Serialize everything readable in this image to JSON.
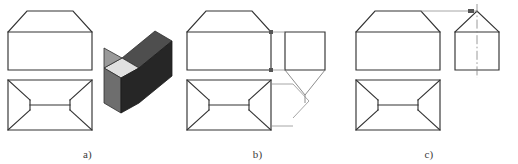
{
  "figure": {
    "type": "orthographic-projection-exercise",
    "background_color": "#ffffff",
    "line_color": "#333333",
    "thin_line_color": "#6f6f6f",
    "centerline_color": "#808080",
    "projection_line_color": "#888888",
    "width_px": 518,
    "height_px": 164
  },
  "panels": [
    {
      "id": "a",
      "label": "a)",
      "caption_position": "bottom-center",
      "views": [
        {
          "name": "front-view",
          "shape": "rectangle-with-two-top-chamfers",
          "x": 8,
          "y": 10,
          "width": 84,
          "height": 60,
          "chamfer": 22,
          "top_horizontal_line_y": 32
        },
        {
          "name": "top-view",
          "shape": "rectangle-with-four-corner-diagonals",
          "x": 8,
          "y": 80,
          "width": 84,
          "height": 50,
          "inner_inset_x": 22
        },
        {
          "name": "pictorial-solid",
          "shape": "chamfered-rectangular-prism",
          "shading": {
            "top_face": "#c9c9c9",
            "chamfer_face": "#e3e3e3",
            "front_face": "#7a7a7a",
            "right_face": "#2b2b2b",
            "top_right_face": "#4a4a4a"
          }
        }
      ]
    },
    {
      "id": "b",
      "label": "b)",
      "caption_position": "bottom-center",
      "views": [
        {
          "name": "front-view",
          "shape": "rectangle-with-two-top-chamfers",
          "x": 12,
          "y": 10,
          "width": 84,
          "height": 60,
          "chamfer": 22,
          "top_horizontal_line_y": 32
        },
        {
          "name": "top-view",
          "shape": "rectangle-with-four-corner-diagonals",
          "x": 12,
          "y": 80,
          "width": 84,
          "height": 50,
          "inner_inset_x": 22
        },
        {
          "name": "side-view-incorrect",
          "shape": "square-with-lower-vee",
          "x": 110,
          "y": 32,
          "width": 40,
          "height": 38,
          "annotation": "incorrect side view with converging lines below"
        }
      ],
      "projection_lines": [
        "front-to-side-upper-tie",
        "front-to-side-lower-tie",
        "top-view-to-right-vee"
      ]
    },
    {
      "id": "c",
      "label": "c)",
      "caption_position": "bottom-center",
      "views": [
        {
          "name": "front-view",
          "shape": "rectangle-with-two-top-chamfers",
          "x": 16,
          "y": 10,
          "width": 84,
          "height": 60,
          "chamfer": 22,
          "top_horizontal_line_y": 32
        },
        {
          "name": "top-view",
          "shape": "rectangle-with-four-corner-diagonals",
          "x": 16,
          "y": 80,
          "width": 84,
          "height": 50,
          "inner_inset_x": 22
        },
        {
          "name": "side-view-correct",
          "shape": "square-with-triangular-roof",
          "x": 115,
          "y": 28,
          "width": 44,
          "height": 42,
          "has_vertical_centerline": true,
          "annotation": "correct side view with apex centerline"
        }
      ],
      "projection_lines": [
        "front-chamfer-apex-to-side-apex",
        "vertical-centerline-through-apex"
      ]
    }
  ]
}
